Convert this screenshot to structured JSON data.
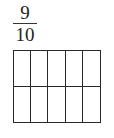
{
  "fraction": {
    "numerator": "9",
    "denominator": "10"
  },
  "grid": {
    "rows": 2,
    "columns": 5,
    "shaded_cells": 0,
    "line_color": "#2a2a2a",
    "fill_color": "#ffffff"
  }
}
